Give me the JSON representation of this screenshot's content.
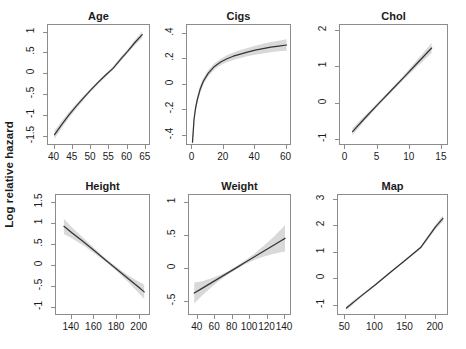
{
  "figure": {
    "ylabel": "Log relative hazard",
    "background": "#ffffff",
    "line_color": "#333333",
    "band_color": "#d9d9d9",
    "axis_color": "#8c8c8c",
    "rows": 2,
    "cols": 3
  },
  "chart_data": [
    {
      "type": "line",
      "title": "Age",
      "xlabel": "",
      "ylabel": "Log relative hazard",
      "xlim": [
        38.2,
        66.4
      ],
      "ylim": [
        -1.72,
        1.18
      ],
      "xticks": [
        40,
        45,
        50,
        55,
        60,
        65
      ],
      "xticklabels": [
        "40",
        "45",
        "50",
        "55",
        "60",
        "65"
      ],
      "yticks": [
        -1.5,
        -1,
        -0.5,
        0,
        0.5,
        1
      ],
      "yticklabels": [
        "-1.5",
        "-1",
        "-.5",
        "0",
        ".5",
        "1"
      ],
      "grid": false,
      "legend": "none",
      "series": [
        {
          "name": "fit",
          "x": [
            40,
            42,
            44,
            46,
            48,
            50,
            52,
            54,
            56,
            58,
            60,
            62,
            64
          ],
          "values": [
            -1.45,
            -1.2,
            -0.97,
            -0.76,
            -0.56,
            -0.37,
            -0.19,
            -0.02,
            0.14,
            0.35,
            0.55,
            0.76,
            0.95
          ],
          "lower": [
            -1.55,
            -1.28,
            -1.04,
            -0.82,
            -0.61,
            -0.41,
            -0.23,
            -0.06,
            0.1,
            0.3,
            0.5,
            0.7,
            0.87
          ],
          "upper": [
            -1.35,
            -1.12,
            -0.9,
            -0.7,
            -0.51,
            -0.33,
            -0.15,
            0.02,
            0.18,
            0.4,
            0.6,
            0.82,
            1.03
          ]
        }
      ]
    },
    {
      "type": "line",
      "title": "Cigs",
      "xlabel": "",
      "ylabel": "",
      "xlim": [
        -3.5,
        63.5
      ],
      "ylim": [
        -0.48,
        0.47
      ],
      "xticks": [
        0,
        20,
        40,
        60
      ],
      "xticklabels": [
        "0",
        "20",
        "40",
        "60"
      ],
      "yticks": [
        -0.4,
        -0.2,
        0,
        0.2,
        0.4
      ],
      "yticklabels": [
        "-.4",
        "-.2",
        "0",
        ".2",
        ".4"
      ],
      "grid": false,
      "legend": "none",
      "series": [
        {
          "name": "fit",
          "x": [
            0,
            1,
            2,
            3,
            5,
            7,
            10,
            14,
            18,
            22,
            26,
            30,
            35,
            40,
            45,
            50,
            55,
            60
          ],
          "values": [
            -0.45,
            -0.27,
            -0.18,
            -0.12,
            -0.03,
            0.03,
            0.09,
            0.145,
            0.18,
            0.205,
            0.225,
            0.24,
            0.257,
            0.272,
            0.285,
            0.296,
            0.305,
            0.313
          ],
          "lower": [
            -0.5,
            -0.3,
            -0.21,
            -0.15,
            -0.06,
            0.005,
            0.065,
            0.12,
            0.155,
            0.178,
            0.196,
            0.209,
            0.224,
            0.237,
            0.247,
            0.256,
            0.263,
            0.268
          ],
          "upper": [
            -0.4,
            -0.24,
            -0.15,
            -0.09,
            0.0,
            0.055,
            0.115,
            0.17,
            0.205,
            0.232,
            0.254,
            0.271,
            0.29,
            0.307,
            0.323,
            0.336,
            0.347,
            0.358
          ]
        }
      ]
    },
    {
      "type": "line",
      "title": "Chol",
      "xlabel": "",
      "ylabel": "",
      "xlim": [
        -0.85,
        16.1
      ],
      "ylim": [
        -1.18,
        2.18
      ],
      "xticks": [
        0,
        5,
        10,
        15
      ],
      "xticklabels": [
        "0",
        "5",
        "10",
        "15"
      ],
      "yticks": [
        -1,
        0,
        1,
        2
      ],
      "yticklabels": [
        "-1",
        "0",
        "1",
        "2"
      ],
      "grid": false,
      "legend": "none",
      "series": [
        {
          "name": "fit",
          "x": [
            1.1,
            3,
            5,
            7,
            9,
            11,
            13.4
          ],
          "values": [
            -0.78,
            -0.41,
            -0.03,
            0.34,
            0.71,
            1.09,
            1.54
          ],
          "lower": [
            -0.88,
            -0.48,
            -0.08,
            0.29,
            0.65,
            1.0,
            1.4
          ],
          "upper": [
            -0.68,
            -0.34,
            0.02,
            0.39,
            0.77,
            1.18,
            1.68
          ]
        }
      ]
    },
    {
      "type": "line",
      "title": "Height",
      "xlabel": "",
      "ylabel": "Log relative hazard",
      "xlim": [
        126,
        210
      ],
      "ylim": [
        -1.18,
        1.68
      ],
      "xticks": [
        140,
        160,
        180,
        200
      ],
      "xticklabels": [
        "140",
        "160",
        "180",
        "200"
      ],
      "yticks": [
        -1,
        -0.5,
        0,
        0.5,
        1,
        1.5
      ],
      "yticklabels": [
        "-1",
        "-.5",
        "0",
        ".5",
        "1",
        "1.5"
      ],
      "grid": false,
      "legend": "none",
      "series": [
        {
          "name": "fit",
          "x": [
            133,
            140,
            150,
            160,
            170,
            180,
            190,
            200,
            204
          ],
          "values": [
            0.94,
            0.79,
            0.58,
            0.36,
            0.14,
            -0.08,
            -0.3,
            -0.52,
            -0.61
          ],
          "lower": [
            0.76,
            0.66,
            0.49,
            0.3,
            0.1,
            -0.13,
            -0.38,
            -0.66,
            -0.78
          ],
          "upper": [
            1.12,
            0.92,
            0.67,
            0.42,
            0.18,
            -0.03,
            -0.22,
            -0.38,
            -0.44
          ]
        }
      ]
    },
    {
      "type": "line",
      "title": "Weight",
      "xlabel": "",
      "ylabel": "",
      "xlim": [
        30,
        148
      ],
      "ylim": [
        -0.72,
        1.12
      ],
      "xticks": [
        40,
        60,
        80,
        100,
        120,
        140
      ],
      "xticklabels": [
        "40",
        "60",
        "80",
        "100",
        "120",
        "140"
      ],
      "yticks": [
        -0.5,
        0,
        0.5,
        1
      ],
      "yticklabels": [
        "-.5",
        "0",
        ".5",
        "1"
      ],
      "grid": false,
      "legend": "none",
      "series": [
        {
          "name": "fit",
          "x": [
            36,
            45,
            55,
            65,
            75,
            85,
            95,
            105,
            115,
            125,
            135,
            140
          ],
          "values": [
            -0.37,
            -0.3,
            -0.22,
            -0.14,
            -0.06,
            0.02,
            0.1,
            0.18,
            0.26,
            0.34,
            0.42,
            0.46
          ],
          "lower": [
            -0.53,
            -0.41,
            -0.29,
            -0.18,
            -0.085,
            -0.005,
            0.07,
            0.13,
            0.18,
            0.22,
            0.25,
            0.26
          ],
          "upper": [
            -0.21,
            -0.19,
            -0.15,
            -0.1,
            -0.035,
            0.045,
            0.13,
            0.23,
            0.34,
            0.46,
            0.59,
            0.66
          ]
        }
      ]
    },
    {
      "type": "line",
      "title": "Map",
      "xlabel": "",
      "ylabel": "",
      "xlim": [
        38,
        222
      ],
      "ylim": [
        -1.38,
        3.18
      ],
      "xticks": [
        50,
        100,
        150,
        200
      ],
      "xticklabels": [
        "50",
        "100",
        "150",
        "200"
      ],
      "yticks": [
        -1,
        0,
        1,
        2,
        3
      ],
      "yticklabels": [
        "-1",
        "0",
        "1",
        "2",
        "3"
      ],
      "grid": false,
      "legend": "none",
      "series": [
        {
          "name": "fit",
          "x": [
            52,
            75,
            100,
            125,
            150,
            175,
            200,
            212
          ],
          "values": [
            -1.08,
            -0.65,
            -0.2,
            0.27,
            0.73,
            1.2,
            1.99,
            2.3
          ],
          "lower": [
            -1.16,
            -0.7,
            -0.24,
            0.23,
            0.69,
            1.15,
            1.9,
            2.18
          ],
          "upper": [
            -1.0,
            -0.6,
            -0.16,
            0.31,
            0.77,
            1.25,
            2.08,
            2.42
          ]
        }
      ]
    }
  ]
}
